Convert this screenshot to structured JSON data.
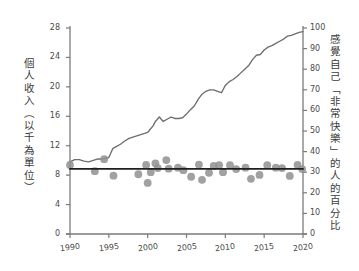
{
  "chart_data": {
    "type": "line",
    "title": "",
    "ylabel_left": "個人收入（以千為單位）",
    "ylabel_right": "感覺自己「非常快樂」的人的百分比",
    "xlabel": "",
    "xlim": [
      1990,
      2020
    ],
    "ylim_left": [
      0,
      28
    ],
    "ylim_right": [
      0,
      100
    ],
    "grid": false,
    "legend": "none",
    "xticks": [
      "1990",
      "1995",
      "2000",
      "2005",
      "2010",
      "2015",
      "2020"
    ],
    "xtick_values": [
      1990,
      1995,
      2000,
      2005,
      2010,
      2015,
      2020
    ],
    "yticks_left": [
      "0",
      "4",
      "8",
      "12",
      "16",
      "20",
      "24",
      "28"
    ],
    "ytick_values_left": [
      0,
      4,
      8,
      12,
      16,
      20,
      24,
      28
    ],
    "yticks_right": [
      "0",
      "10",
      "20",
      "30",
      "40",
      "50",
      "60",
      "70",
      "80",
      "90",
      "100"
    ],
    "ytick_values_right": [
      0,
      10,
      20,
      30,
      40,
      50,
      60,
      70,
      80,
      90,
      100
    ],
    "series": [
      {
        "name": "個人收入",
        "axis": "left",
        "type": "line",
        "color": "#6e6e6e",
        "x": [
          1990,
          1990.6,
          1991.2,
          1991.8,
          1992.4,
          1993,
          1993.6,
          1994.2,
          1994.6,
          1995,
          1995.5,
          1996,
          1996.5,
          1997,
          1997.6,
          1998.2,
          1998.8,
          1999.4,
          2000,
          2000.3,
          2000.7,
          2001,
          2001.5,
          2002,
          2002.5,
          2003,
          2003.5,
          2004,
          2004.5,
          2005,
          2005.5,
          2006,
          2006.5,
          2007,
          2007.5,
          2008,
          2008.5,
          2009,
          2009.5,
          2010,
          2010.5,
          2011,
          2011.5,
          2012,
          2012.5,
          2013,
          2013.5,
          2014,
          2014.5,
          2015,
          2015.5,
          2016,
          2016.5,
          2017,
          2017.5,
          2018,
          2018.5,
          2019,
          2019.5,
          2020
        ],
        "y": [
          9.8,
          10.1,
          10.1,
          9.9,
          9.8,
          10.0,
          10.2,
          10.2,
          10.3,
          10.4,
          11.6,
          11.9,
          12.2,
          12.6,
          13.0,
          13.2,
          13.4,
          13.6,
          13.8,
          14.2,
          14.7,
          15.3,
          15.9,
          15.3,
          15.6,
          15.9,
          15.7,
          15.7,
          15.8,
          16.3,
          16.9,
          17.4,
          18.3,
          19.0,
          19.4,
          19.6,
          19.6,
          19.4,
          19.2,
          20.2,
          20.7,
          21.0,
          21.4,
          21.9,
          22.4,
          22.9,
          23.7,
          24.3,
          24.4,
          25.0,
          25.4,
          25.6,
          25.9,
          26.2,
          26.5,
          26.9,
          27.0,
          27.2,
          27.4,
          27.5
        ]
      },
      {
        "name": "感覺自己「非常快樂」的人的百分比",
        "axis": "right",
        "type": "scatter",
        "color": "#909090",
        "points": [
          {
            "x": 1990.0,
            "y": 33.5
          },
          {
            "x": 1993.2,
            "y": 30.5
          },
          {
            "x": 1994.4,
            "y": 36.3
          },
          {
            "x": 1995.6,
            "y": 28.3
          },
          {
            "x": 1998.8,
            "y": 29.0
          },
          {
            "x": 1999.8,
            "y": 33.5
          },
          {
            "x": 2000.0,
            "y": 24.8
          },
          {
            "x": 2000.4,
            "y": 30.0
          },
          {
            "x": 2001.0,
            "y": 34.3
          },
          {
            "x": 2001.3,
            "y": 32.0
          },
          {
            "x": 2002.4,
            "y": 35.9
          },
          {
            "x": 2002.7,
            "y": 31.7
          },
          {
            "x": 2003.9,
            "y": 32.2
          },
          {
            "x": 2004.6,
            "y": 31.0
          },
          {
            "x": 2005.6,
            "y": 27.8
          },
          {
            "x": 2006.6,
            "y": 33.7
          },
          {
            "x": 2007.0,
            "y": 26.3
          },
          {
            "x": 2007.9,
            "y": 29.7
          },
          {
            "x": 2008.5,
            "y": 33.0
          },
          {
            "x": 2009.2,
            "y": 33.4
          },
          {
            "x": 2009.7,
            "y": 30.0
          },
          {
            "x": 2010.6,
            "y": 33.4
          },
          {
            "x": 2011.4,
            "y": 31.5
          },
          {
            "x": 2012.6,
            "y": 32.2
          },
          {
            "x": 2013.3,
            "y": 26.8
          },
          {
            "x": 2014.4,
            "y": 28.7
          },
          {
            "x": 2015.4,
            "y": 33.4
          },
          {
            "x": 2016.5,
            "y": 32.2
          },
          {
            "x": 2017.3,
            "y": 32.0
          },
          {
            "x": 2018.3,
            "y": 28.2
          },
          {
            "x": 2019.3,
            "y": 33.6
          },
          {
            "x": 2019.9,
            "y": 31.5
          }
        ]
      },
      {
        "name": "快樂趨勢線",
        "axis": "right",
        "type": "trendline",
        "color": "#1f1f1f",
        "x": [
          1990,
          2020
        ],
        "y": [
          31.6,
          31.6
        ]
      }
    ]
  },
  "colors": {
    "axis": "#7a7a7a",
    "line": "#6e6e6e",
    "scatter": "#909090",
    "trend": "#1f1f1f",
    "text": "#3b3b3b",
    "background": "#ffffff"
  }
}
